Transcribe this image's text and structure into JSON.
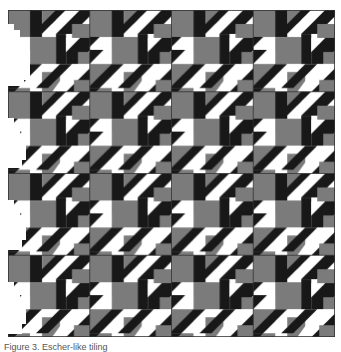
{
  "figure": {
    "grid": {
      "rows": 4,
      "cols": 4,
      "tile_size_px": 82
    },
    "colors": {
      "white": "#ffffff",
      "gray": "#7b7b7b",
      "black": "#181818",
      "divider": "#333333"
    }
  },
  "caption": {
    "text": "Figure 3. Escher-like tiling"
  }
}
